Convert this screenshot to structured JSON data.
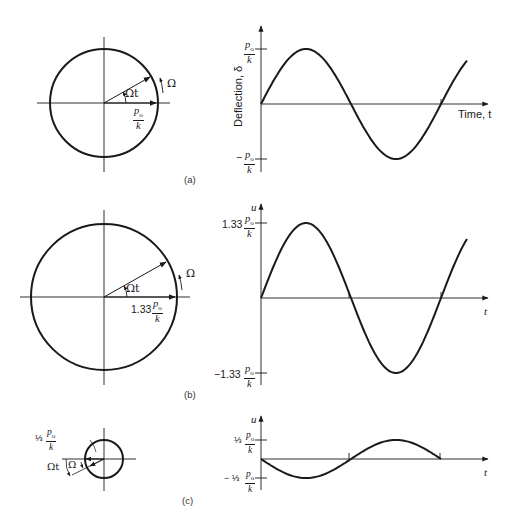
{
  "figure": {
    "panels": [
      {
        "id": "a",
        "label": "(a)",
        "phasor": {
          "amplitude_label_num": "p",
          "amplitude_label_sub": "o",
          "amplitude_label_den": "k",
          "amplitude_coef": "",
          "angle_label": "Ωt",
          "rotation_label": "Ω"
        },
        "plot": {
          "y_axis_label": "Deflection, δ",
          "x_axis_label": "Time, t",
          "y_max_coef": "",
          "y_min_coef": "−",
          "tick_num": "p",
          "tick_sub": "o",
          "tick_den": "k"
        }
      },
      {
        "id": "b",
        "label": "(b)",
        "phasor": {
          "amplitude_coef": "1.33",
          "amplitude_label_num": "p",
          "amplitude_label_sub": "o",
          "amplitude_label_den": "k",
          "angle_label": "Ωt",
          "rotation_label": "Ω"
        },
        "plot": {
          "y_axis_label": "u",
          "x_axis_label": "t",
          "y_max_coef": "1.33",
          "y_min_coef": "−1.33",
          "tick_num": "p",
          "tick_sub": "o",
          "tick_den": "k"
        }
      },
      {
        "id": "c",
        "label": "(c)",
        "phasor": {
          "amplitude_coef": "⅓",
          "amplitude_label_num": "p",
          "amplitude_label_sub": "o",
          "amplitude_label_den": "k",
          "angle_label": "Ωt",
          "rotation_label": "Ω"
        },
        "plot": {
          "y_axis_label": "u",
          "x_axis_label": "t",
          "y_max_coef": "⅓",
          "y_min_coef": "− ⅓",
          "tick_num": "p",
          "tick_sub": "o",
          "tick_den": "k"
        }
      }
    ]
  },
  "chart_data": [
    {
      "type": "line",
      "title": "(a)",
      "xlabel": "Time, t",
      "ylabel": "Deflection, δ",
      "y_ticks": [
        "p0/k",
        "-p0/k"
      ],
      "series": [
        {
          "name": "δ(t) = (p0/k) sin Ωt",
          "amplitude": 1.0,
          "phase": 0,
          "cycles": 1.15
        }
      ]
    },
    {
      "type": "line",
      "title": "(b)",
      "xlabel": "t",
      "ylabel": "u",
      "y_ticks": [
        "1.33 p0/k",
        "-1.33 p0/k"
      ],
      "series": [
        {
          "name": "u(t) = 1.33 (p0/k) sin Ωt",
          "amplitude": 1.33,
          "phase": 0,
          "cycles": 1.15
        }
      ]
    },
    {
      "type": "line",
      "title": "(c)",
      "xlabel": "t",
      "ylabel": "u",
      "y_ticks": [
        "1/3 p0/k",
        "-1/3 p0/k"
      ],
      "series": [
        {
          "name": "u(t) = -(1/3)(p0/k) sin Ωt",
          "amplitude": -0.333,
          "phase": 0,
          "cycles": 1.0
        }
      ]
    }
  ]
}
